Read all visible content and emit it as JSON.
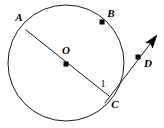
{
  "figure": {
    "background_color": "#ffffff",
    "stroke_color": "#1a1a1a",
    "label_color": "#000000",
    "width": 164,
    "height": 128
  },
  "circle": {
    "name": "circle-O",
    "center_x": 66,
    "center_y": 63,
    "radius": 58
  },
  "points": {
    "A": {
      "label": "A",
      "x": 26,
      "y": 30,
      "label_x": 19,
      "label_y": 18,
      "has_dot": false
    },
    "B": {
      "label": "B",
      "x": 102,
      "y": 22,
      "label_x": 111,
      "label_y": 14,
      "has_dot": true
    },
    "O": {
      "label": "O",
      "x": 66,
      "y": 64,
      "label_x": 66,
      "label_y": 51,
      "has_dot": true
    },
    "C": {
      "label": "C",
      "x": 109,
      "y": 96,
      "label_x": 115,
      "label_y": 105,
      "has_dot": false
    },
    "D": {
      "label": "D",
      "x": 138,
      "y": 57,
      "label_x": 148,
      "label_y": 64,
      "has_dot": true
    }
  },
  "segments": {
    "diameter_AC": {
      "name": "segment-AC",
      "x1": 26,
      "y1": 30,
      "x2": 109,
      "y2": 96
    },
    "ray_CD": {
      "name": "ray-CD",
      "x1": 105,
      "y1": 103,
      "x2": 154,
      "y2": 39,
      "arrow_tip_x": 157,
      "arrow_tip_y": 35
    }
  },
  "angles": {
    "angle_1": {
      "label": "1",
      "label_x": 103,
      "label_y": 85
    }
  }
}
